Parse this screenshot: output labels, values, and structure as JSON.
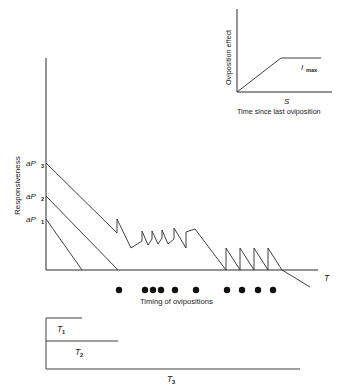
{
  "figure": {
    "title": "",
    "background_color": "#ffffff",
    "line_color": "#2b2b2b",
    "dot_color": "#111111"
  },
  "main_plot": {
    "y_axis_label": "Responsiveness",
    "x_axis_label": "T",
    "y_tick_labels": [
      {
        "base": "aP",
        "sub": "1"
      },
      {
        "base": "aP",
        "sub": "2"
      },
      {
        "base": "aP",
        "sub": "3"
      }
    ],
    "ovipositions_caption": "Timing of ovipositions",
    "brackets": [
      {
        "label_base": "T",
        "label_sub": "1"
      },
      {
        "label_base": "T",
        "label_sub": "2"
      },
      {
        "label_base": "T",
        "label_sub": "3"
      }
    ]
  },
  "inset_plot": {
    "y_axis_label": "Oviposition effect",
    "x_axis_label": "Time since last oviposition",
    "x_marker_label": "S",
    "plateau_label_base": "I",
    "plateau_label_sub": "max"
  },
  "chart_data": {
    "type": "line",
    "xlabel": "T",
    "ylabel": "Responsiveness",
    "xlim": [
      0,
      347
    ],
    "ylim": [
      0,
      1
    ],
    "grid": false,
    "legend": "none",
    "axes_pixels": {
      "y_axis_x": 46,
      "y_axis_top": 58,
      "x_axis_y": 270,
      "x_axis_right": 318
    },
    "y_tick_values": [
      {
        "label": "aP1",
        "y_px": 219
      },
      {
        "label": "aP2",
        "y_px": 196
      },
      {
        "label": "aP3",
        "y_px": 163
      }
    ],
    "series": [
      {
        "name": "decay-from-aP1",
        "points": [
          [
            46,
            219
          ],
          [
            82,
            270
          ]
        ]
      },
      {
        "name": "decay-from-aP2",
        "points": [
          [
            46,
            196
          ],
          [
            118,
            270
          ]
        ]
      },
      {
        "name": "decay-from-aP3-with-sawtooth",
        "points": [
          [
            46,
            163
          ],
          [
            117,
            233
          ],
          [
            117,
            219
          ],
          [
            131,
            248
          ],
          [
            142,
            241
          ],
          [
            142,
            231
          ],
          [
            148,
            245
          ],
          [
            152,
            239
          ],
          [
            152,
            231
          ],
          [
            158,
            244
          ],
          [
            162,
            238
          ],
          [
            162,
            230
          ],
          [
            168,
            244
          ],
          [
            174,
            239
          ],
          [
            174,
            228
          ],
          [
            186,
            248
          ],
          [
            186,
            232
          ],
          [
            195,
            229
          ],
          [
            226,
            270
          ],
          [
            226,
            248
          ],
          [
            240,
            270
          ],
          [
            240,
            248
          ],
          [
            254,
            270
          ],
          [
            254,
            248
          ],
          [
            268,
            270
          ],
          [
            268,
            248
          ],
          [
            282,
            270
          ],
          [
            310,
            287
          ]
        ]
      }
    ],
    "oviposition_dots": {
      "y_px": 290,
      "radius_px": 3.2,
      "x_px": [
        119,
        145,
        153,
        161,
        175,
        196,
        227,
        242,
        258,
        273
      ]
    },
    "brackets_px": [
      {
        "label": "T1",
        "y": 318,
        "x_start": 46,
        "x_end": 82,
        "label_x": 60,
        "label_y": 331
      },
      {
        "label": "T2",
        "y": 341,
        "x_start": 46,
        "x_end": 118,
        "label_x": 78,
        "label_y": 354
      },
      {
        "label": "T3",
        "y": 369,
        "x_start": 46,
        "x_end": 300,
        "label_x": 170,
        "label_y": 381
      }
    ]
  },
  "inset_chart_data": {
    "type": "line",
    "title": "Oviposition effect vs time since last oviposition",
    "xlabel": "Time since last oviposition",
    "ylabel": "Oviposition effect",
    "grid": false,
    "axes_pixels": {
      "y_axis_x": 237,
      "y_axis_top": 9,
      "x_axis_y": 92,
      "x_axis_right": 332
    },
    "series": [
      {
        "name": "effect-ramp-plateau",
        "points": [
          [
            237,
            92
          ],
          [
            281,
            58
          ],
          [
            321,
            58
          ]
        ]
      }
    ],
    "annotations": [
      {
        "text": "S",
        "x_px": 287,
        "y_px": 103
      },
      {
        "text": "Imax",
        "x_px": 305,
        "y_px": 69
      }
    ]
  }
}
